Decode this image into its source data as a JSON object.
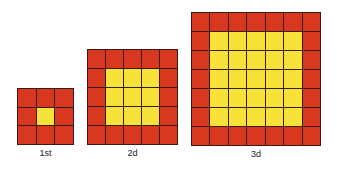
{
  "figures": [
    {
      "id": "first",
      "label": "1st",
      "size": 3,
      "inner_size": 1,
      "x": 17,
      "y": 88,
      "width": 57,
      "height": 57
    },
    {
      "id": "second",
      "label": "2d",
      "size": 5,
      "inner_size": 3,
      "x": 87,
      "y": 49,
      "width": 91,
      "height": 96
    },
    {
      "id": "third",
      "label": "3d",
      "size": 7,
      "inner_size": 5,
      "x": 191,
      "y": 12,
      "width": 130,
      "height": 134
    }
  ],
  "colors": {
    "border_cell": "#d8381f",
    "inner_cell": "#f7e23a",
    "grid_line": "#3a1a12"
  }
}
